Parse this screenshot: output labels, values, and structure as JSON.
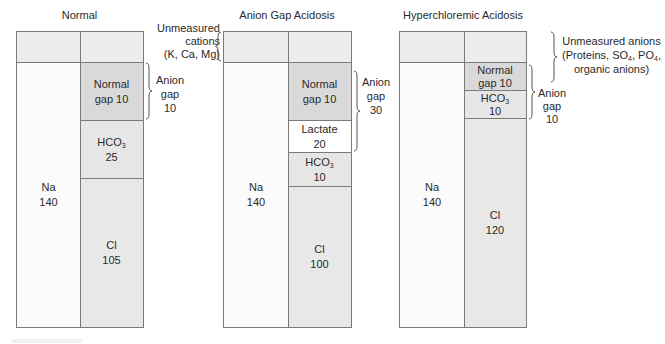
{
  "panels": [
    {
      "title": "Normal",
      "cells": {
        "na": {
          "name": "Na",
          "value": "140"
        },
        "gap": {
          "name": "Normal",
          "value": "gap 10"
        },
        "hco3": {
          "name": "HCO",
          "sub": "3",
          "value": "25"
        },
        "cl": {
          "name": "Cl",
          "value": "105"
        }
      },
      "annotation": {
        "line1": "Anion",
        "line2": "gap",
        "line3": "10"
      }
    },
    {
      "title": "Anion Gap Acidosis",
      "cells": {
        "na": {
          "name": "Na",
          "value": "140"
        },
        "gap": {
          "name": "Normal",
          "value": "gap 10"
        },
        "lactate": {
          "name": "Lactate",
          "value": "20"
        },
        "hco3": {
          "name": "HCO",
          "sub": "3",
          "value": "10"
        },
        "cl": {
          "name": "Cl",
          "value": "100"
        }
      },
      "annotation": {
        "line1": "Anion",
        "line2": "gap",
        "line3": "30"
      }
    },
    {
      "title": "Hyperchloremic Acidosis",
      "cells": {
        "na": {
          "name": "Na",
          "value": "140"
        },
        "gap": {
          "name": "Normal",
          "value": "gap 10"
        },
        "hco3": {
          "name": "HCO",
          "sub": "3",
          "value": "10"
        },
        "cl": {
          "name": "Cl",
          "value": "120"
        }
      },
      "annotation": {
        "line1": "Anion",
        "line2": "gap",
        "line3": "10"
      }
    }
  ],
  "labels": {
    "unmeasured_cations": {
      "line1": "Unmeasured",
      "line2": "cations",
      "line3": "(K, Ca, Mg)"
    },
    "unmeasured_anions": {
      "line1": "Unmeasured anions",
      "line2a": "(Proteins, SO",
      "sub1": "4",
      "line2b": ", PO",
      "sub2": "4",
      "line2c": ",",
      "line3": "organic anions)"
    }
  }
}
